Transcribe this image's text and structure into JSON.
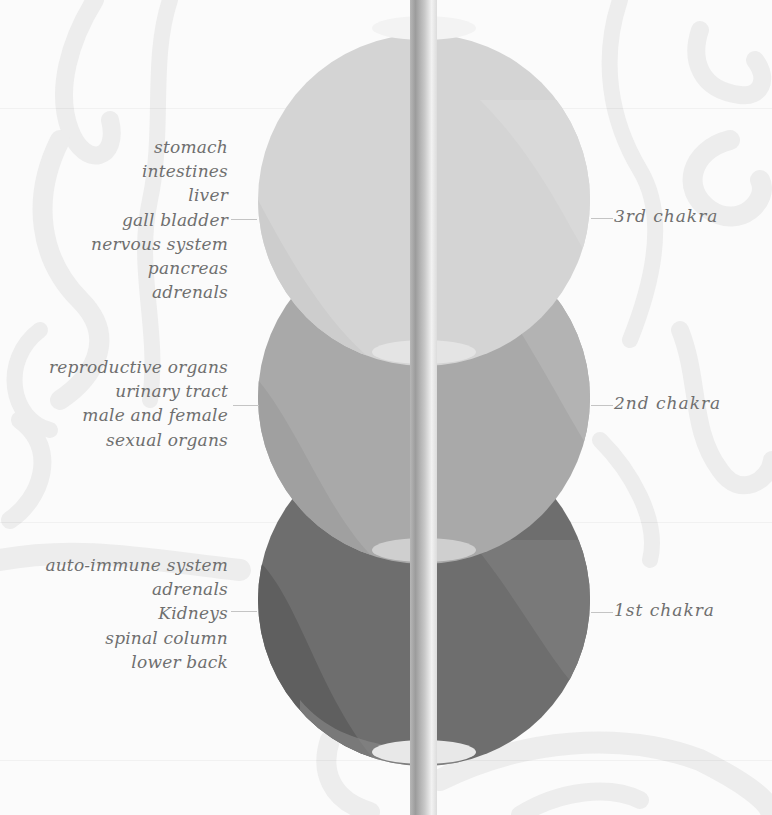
{
  "diagram": {
    "colors": {
      "background": "#fbfbfb",
      "chakra_3": "#d4d4d4",
      "chakra_2": "#a9a9a9",
      "chakra_1": "#6e6e6e",
      "label_text": "#6f6f6f",
      "leader_line": "#c4c4c4",
      "highlight_ellipse": "#eeeeee"
    },
    "chakras": [
      {
        "id": "3rd",
        "label": "3rd chakra",
        "organs": [
          "stomach",
          "intestines",
          "liver",
          "gall bladder",
          "nervous system",
          "pancreas",
          "adrenals"
        ]
      },
      {
        "id": "2nd",
        "label": "2nd chakra",
        "organs": [
          "reproductive organs",
          "urinary tract",
          "male and female",
          "sexual organs"
        ]
      },
      {
        "id": "1st",
        "label": "1st chakra",
        "organs": [
          "auto-immune system",
          "adrenals",
          "Kidneys",
          "spinal column",
          "lower back"
        ]
      }
    ]
  }
}
